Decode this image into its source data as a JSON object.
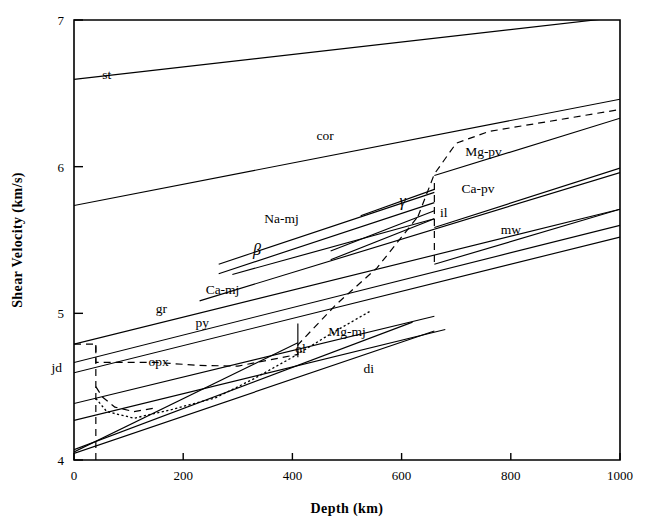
{
  "figure": {
    "title": "",
    "background": "#ffffff",
    "ink_color": "#000000"
  },
  "axes": {
    "x_title": "Depth (km)",
    "y_title": "Shear Velocity (km/s)",
    "x_ticks": [
      "0",
      "200",
      "400",
      "600",
      "800",
      "1000"
    ],
    "y_ticks": [
      "4",
      "5",
      "6",
      "7"
    ],
    "y_extra_tick_label": "jd"
  },
  "chart_data": {
    "type": "line",
    "title": "",
    "xlabel": "Depth (km)",
    "ylabel": "Shear Velocity (km/s)",
    "xlim": [
      0,
      1000
    ],
    "ylim": [
      4,
      7
    ],
    "xticks": [
      0,
      200,
      400,
      600,
      800,
      1000
    ],
    "yticks": [
      4,
      5,
      6,
      7
    ],
    "grid": false,
    "legend": "inline-labels",
    "series": [
      {
        "name": "st",
        "label": "st",
        "style": "solid",
        "label_xy": [
          60,
          6.6
        ],
        "x": [
          0,
          1000
        ],
        "y": [
          6.595,
          7.02
        ]
      },
      {
        "name": "cor",
        "label": "cor",
        "style": "solid",
        "label_xy": [
          460,
          6.18
        ],
        "x": [
          0,
          1000
        ],
        "y": [
          5.735,
          6.46
        ]
      },
      {
        "name": "Mg-pv",
        "label": "Mg-pv",
        "style": "solid",
        "label_xy": [
          750,
          6.07
        ],
        "x": [
          660,
          1000
        ],
        "y": [
          5.94,
          6.33
        ]
      },
      {
        "name": "Mg-pv-dashed",
        "label": "",
        "style": "dashed",
        "label_xy": null,
        "x": [
          630,
          660,
          700,
          760,
          1000
        ],
        "y": [
          5.66,
          5.95,
          6.16,
          6.24,
          6.39
        ]
      },
      {
        "name": "Ca-pv",
        "label": "Ca-pv",
        "style": "solid",
        "label_xy": [
          740,
          5.82
        ],
        "x": [
          660,
          1000
        ],
        "y": [
          5.585,
          5.99
        ]
      },
      {
        "name": "gamma",
        "label": "γ",
        "style": "solid",
        "label_xy": [
          602,
          5.73
        ],
        "x": [
          525,
          660
        ],
        "y": [
          5.665,
          5.845
        ]
      },
      {
        "name": "il",
        "label": "il",
        "style": "solid",
        "label_xy": [
          677,
          5.66
        ],
        "x": [
          470,
          660
        ],
        "y": [
          5.425,
          5.7
        ]
      },
      {
        "name": "il-lower",
        "label": "",
        "style": "solid",
        "label_xy": null,
        "x": [
          470,
          660
        ],
        "y": [
          5.365,
          5.645
        ]
      },
      {
        "name": "Na-mj",
        "label": "Na-mj",
        "style": "solid",
        "label_xy": [
          380,
          5.615
        ],
        "x": [
          265,
          660
        ],
        "y": [
          5.335,
          5.825
        ]
      },
      {
        "name": "Na-mj-lower",
        "label": "",
        "style": "solid",
        "label_xy": null,
        "x": [
          265,
          660
        ],
        "y": [
          5.27,
          5.755
        ]
      },
      {
        "name": "beta",
        "label": "β",
        "style": "solid",
        "label_xy": [
          335,
          5.4
        ],
        "x": [
          290,
          660
        ],
        "y": [
          5.265,
          5.645
        ]
      },
      {
        "name": "mw",
        "label": "mw",
        "style": "solid",
        "label_xy": [
          800,
          5.54
        ],
        "x": [
          660,
          1000
        ],
        "y": [
          5.335,
          5.71
        ]
      },
      {
        "name": "Ca-mj",
        "label": "Ca-mj",
        "style": "solid",
        "label_xy": [
          272,
          5.13
        ],
        "x": [
          230,
          1000
        ],
        "y": [
          5.085,
          5.96
        ]
      },
      {
        "name": "gr",
        "label": "gr",
        "style": "solid",
        "label_xy": [
          160,
          5.0
        ],
        "x": [
          0,
          1000
        ],
        "y": [
          4.79,
          5.71
        ]
      },
      {
        "name": "py",
        "label": "py",
        "style": "solid",
        "label_xy": [
          235,
          4.905
        ],
        "x": [
          0,
          1000
        ],
        "y": [
          4.665,
          5.6
        ]
      },
      {
        "name": "jd",
        "label": "jd",
        "style": "solid",
        "label_xy": [
          -40,
          4.6
        ],
        "x": [
          0,
          1000
        ],
        "y": [
          4.595,
          5.52
        ]
      },
      {
        "name": "Mg-mj",
        "label": "Mg-mj",
        "style": "solid",
        "label_xy": [
          500,
          4.845
        ],
        "x": [
          0,
          660
        ],
        "y": [
          4.385,
          4.98
        ]
      },
      {
        "name": "ol",
        "label": "ol",
        "style": "solid",
        "label_xy": [
          415,
          4.73
        ],
        "x": [
          0,
          410
        ],
        "y": [
          4.055,
          4.8
        ]
      },
      {
        "name": "opx",
        "label": "opx",
        "style": "solid",
        "label_xy": [
          155,
          4.64
        ],
        "x": [
          0,
          620
        ],
        "y": [
          4.07,
          4.94
        ]
      },
      {
        "name": "di",
        "label": "di",
        "style": "solid",
        "label_xy": [
          540,
          4.59
        ],
        "x": [
          0,
          680
        ],
        "y": [
          4.27,
          4.89
        ]
      },
      {
        "name": "lower-aux",
        "label": "",
        "style": "solid",
        "label_xy": null,
        "x": [
          0,
          660
        ],
        "y": [
          4.045,
          4.88
        ]
      },
      {
        "name": "upper-transition-dashed",
        "label": "",
        "style": "dashed",
        "label_xy": null,
        "x": [
          0,
          40,
          40,
          150,
          230,
          300,
          410,
          410,
          480,
          555,
          630
        ],
        "y": [
          4.79,
          4.79,
          4.665,
          4.665,
          4.645,
          4.64,
          4.72,
          4.785,
          5.06,
          5.31,
          5.66
        ]
      },
      {
        "name": "lower-mantle-dotted",
        "label": "",
        "style": "dotted",
        "label_xy": null,
        "x": [
          40,
          60,
          110,
          180,
          260,
          330,
          400,
          470,
          545
        ],
        "y": [
          4.42,
          4.33,
          4.285,
          4.345,
          4.425,
          4.555,
          4.7,
          4.86,
          5.02
        ]
      },
      {
        "name": "jd-vertical-dashed",
        "label": "",
        "style": "dashed",
        "label_xy": null,
        "x": [
          40,
          40
        ],
        "y": [
          4.0,
          4.79
        ]
      },
      {
        "name": "jd-hook-dashed",
        "label": "",
        "style": "dashed",
        "label_xy": null,
        "x": [
          40,
          52,
          75,
          110,
          150
        ],
        "y": [
          4.5,
          4.43,
          4.36,
          4.33,
          4.355
        ]
      },
      {
        "name": "depth-660-vertical-dashed",
        "label": "",
        "style": "dashed",
        "label_xy": null,
        "x": [
          660,
          660
        ],
        "y": [
          5.35,
          5.92
        ]
      },
      {
        "name": "depth-410-vertical",
        "label": "",
        "style": "solid",
        "label_xy": null,
        "x": [
          410,
          410
        ],
        "y": [
          4.7,
          4.93
        ]
      }
    ],
    "annotations": [
      {
        "text": "st",
        "x": 60,
        "y": 6.6
      },
      {
        "text": "cor",
        "x": 460,
        "y": 6.18
      },
      {
        "text": "Mg-pv",
        "x": 750,
        "y": 6.07
      },
      {
        "text": "Ca-pv",
        "x": 740,
        "y": 5.82
      },
      {
        "text": "γ",
        "x": 602,
        "y": 5.73
      },
      {
        "text": "il",
        "x": 677,
        "y": 5.66
      },
      {
        "text": "Na-mj",
        "x": 380,
        "y": 5.615
      },
      {
        "text": "β",
        "x": 335,
        "y": 5.4
      },
      {
        "text": "mw",
        "x": 800,
        "y": 5.54
      },
      {
        "text": "Ca-mj",
        "x": 272,
        "y": 5.13
      },
      {
        "text": "gr",
        "x": 160,
        "y": 5.0
      },
      {
        "text": "py",
        "x": 235,
        "y": 4.905
      },
      {
        "text": "Mg-mj",
        "x": 500,
        "y": 4.845
      },
      {
        "text": "ol",
        "x": 415,
        "y": 4.73
      },
      {
        "text": "opx",
        "x": 155,
        "y": 4.64
      },
      {
        "text": "di",
        "x": 540,
        "y": 4.59
      },
      {
        "text": "jd",
        "x": -40,
        "y": 4.6
      }
    ]
  }
}
